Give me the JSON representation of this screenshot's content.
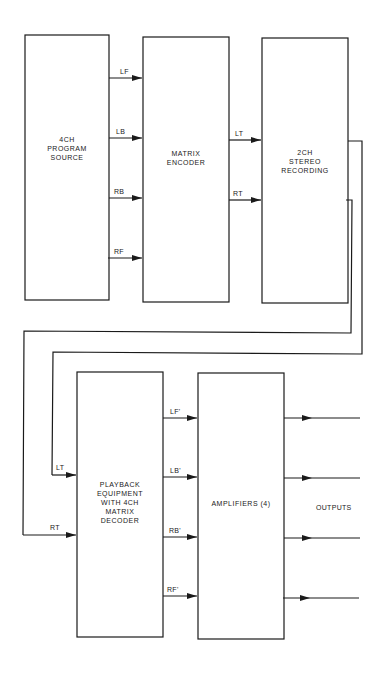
{
  "blocks": {
    "source": "4CH\nPROGRAM\nSOURCE",
    "encoder": "MATRIX\nENCODER",
    "recording": "2CH\nSTEREO\nRECORDING",
    "playback": "PLAYBACK\nEQUIPMENT\nWITH 4CH\nMATRIX\nDECODER",
    "amplifiers": "AMPLIFIERS (4)"
  },
  "signals": {
    "source_out": [
      "LF",
      "LB",
      "RB",
      "RF"
    ],
    "encoder_out": [
      "LT",
      "RT"
    ],
    "playback_in": [
      "LT",
      "RT"
    ],
    "decoder_out": [
      "LF'",
      "LB'",
      "RB'",
      "RF'"
    ]
  },
  "outputs_label": "OUTPUTS",
  "colors": {
    "line": "#1a1a1a",
    "background": "#ffffff"
  }
}
